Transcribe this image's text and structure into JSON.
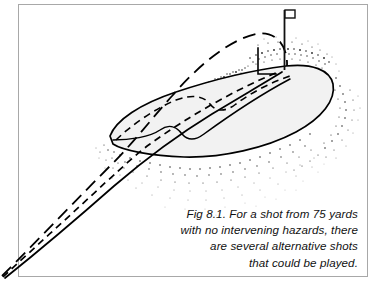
{
  "figure": {
    "id": "fig-8-1",
    "kind": "line-drawing",
    "background_color": "#ffffff",
    "border": {
      "color": "#a8a8a8",
      "width_px": 1,
      "left": 18,
      "top": 4,
      "right": 368,
      "bottom": 277
    },
    "green": {
      "label": "putting-green",
      "fill_color": "#f2f2f2",
      "outline_color": "#000000",
      "outline_width_px": 1.6
    },
    "rough": {
      "label": "stippled-rough",
      "dot_color": "#1a1a1a"
    },
    "flag": {
      "label": "pin-flag",
      "pole_color": "#111111",
      "flag_color": "#ffffff",
      "pole_x": 284,
      "pole_top_y": 10,
      "pole_bottom_y": 70
    },
    "shot_paths": [
      {
        "name": "lofted-pitch",
        "style": "long-dash",
        "color": "#000000"
      },
      {
        "name": "pitch-and-run",
        "style": "short-dash",
        "color": "#000000"
      },
      {
        "name": "low-running-chip",
        "style": "solid",
        "color": "#000000"
      }
    ],
    "contours": [
      {
        "name": "green-ridge-solid",
        "style": "solid"
      },
      {
        "name": "green-tier-dashed",
        "style": "short-dash"
      }
    ]
  },
  "caption": {
    "name": "figure-caption",
    "align": "right",
    "lines": [
      "Fig 8.1. For a shot from 75 yards",
      "with no intervening hazards, there",
      "are several alternative shots",
      "that could be played."
    ],
    "line1": "Fig 8.1. For a shot from 75 yards",
    "line2": "with no intervening hazards, there",
    "line3": "are several alternative shots",
    "line4": "that could be played.",
    "full_text": "Fig 8.1. For a shot from 75 yards with no intervening hazards, there are several alternative shots that could be played."
  }
}
